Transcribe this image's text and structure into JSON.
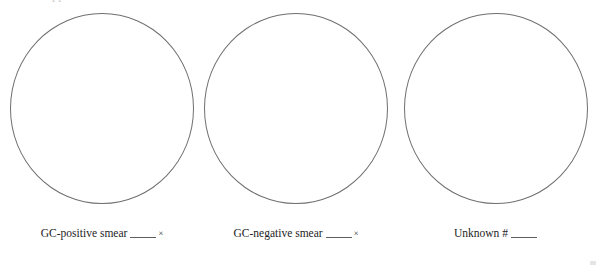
{
  "page": {
    "background_color": "#ffffff",
    "clipped_heading_fragment": "pp",
    "circle_stroke_color": "#6f6f6f",
    "text_color": "#1d1d1d"
  },
  "drawing_fields": [
    {
      "id": "gc-positive-smear",
      "circle_label": "drawing-circle",
      "caption_text": "GC-positive smear",
      "blank_value": "",
      "magnification_symbol": "×",
      "has_magnification": true
    },
    {
      "id": "gc-negative-smear",
      "circle_label": "drawing-circle",
      "caption_text": "GC-negative smear",
      "blank_value": "",
      "magnification_symbol": "×",
      "has_magnification": true
    },
    {
      "id": "unknown-specimen",
      "circle_label": "drawing-circle",
      "caption_text": "Unknown #",
      "blank_value": "",
      "magnification_symbol": "",
      "has_magnification": false
    }
  ]
}
